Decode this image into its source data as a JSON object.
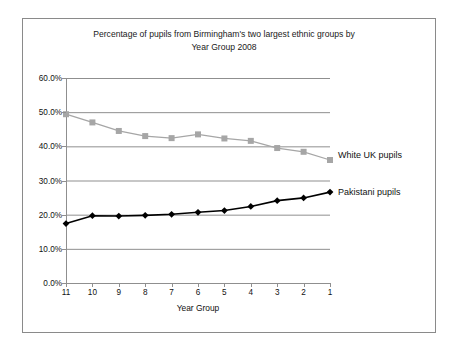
{
  "chart_data": {
    "type": "line",
    "title": "Percentage of pupils from Birmingham's two largest ethnic groups by\nYear Group 2008",
    "xlabel": "Year Group",
    "ylabel": "",
    "categories": [
      "11",
      "10",
      "9",
      "8",
      "7",
      "6",
      "5",
      "4",
      "3",
      "2",
      "1"
    ],
    "ylim": [
      0,
      60
    ],
    "ytick_labels": [
      "0.0%",
      "10.0%",
      "20.0%",
      "30.0%",
      "40.0%",
      "50.0%",
      "60.0%"
    ],
    "ytick_values": [
      0,
      10,
      20,
      30,
      40,
      50,
      60
    ],
    "grid": true,
    "legend_position": "right-inline",
    "series": [
      {
        "name": "White UK pupils",
        "color": "#a6a6a6",
        "marker": "square",
        "values": [
          49.4,
          47.0,
          44.5,
          43.0,
          42.4,
          43.5,
          42.3,
          41.6,
          39.5,
          38.4,
          36.0
        ]
      },
      {
        "name": "Pakistani pupils",
        "color": "#000000",
        "marker": "diamond",
        "values": [
          17.4,
          19.7,
          19.6,
          19.8,
          20.1,
          20.7,
          21.2,
          22.4,
          24.1,
          24.9,
          26.6
        ]
      }
    ]
  },
  "labels": {
    "white_uk": "White UK pupils",
    "pakistani": "Pakistani pupils"
  }
}
